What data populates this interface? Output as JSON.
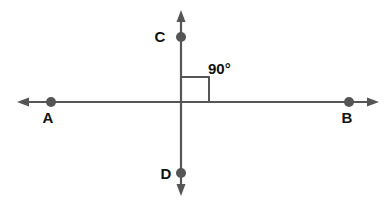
{
  "diagram": {
    "type": "perpendicular-lines",
    "colors": {
      "line": "#555555",
      "point": "#555555",
      "text": "#111111"
    },
    "lines": [
      {
        "name": "line-AB",
        "orientation": "horizontal",
        "x1": 18,
        "y1": 102,
        "x2": 378,
        "y2": 102
      },
      {
        "name": "line-CD",
        "orientation": "vertical",
        "x1": 181,
        "y1": 10,
        "x2": 181,
        "y2": 196
      }
    ],
    "points": [
      {
        "label": "A",
        "cx": 51,
        "cy": 102,
        "lx": 48,
        "ly": 123
      },
      {
        "label": "B",
        "cx": 349,
        "cy": 102,
        "lx": 347,
        "ly": 123
      },
      {
        "label": "C",
        "cx": 181,
        "cy": 37,
        "lx": 160,
        "ly": 42
      },
      {
        "label": "D",
        "cx": 181,
        "cy": 173,
        "lx": 166,
        "ly": 179
      }
    ],
    "angle": {
      "label": "90°",
      "lx": 208,
      "ly": 74
    }
  }
}
